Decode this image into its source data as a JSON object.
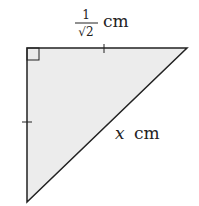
{
  "diagram": {
    "type": "right-isosceles-triangle",
    "fill_color": "#ececec",
    "stroke_color": "#222222",
    "labels": {
      "top_numerator": "1",
      "top_denominator": "√2",
      "top_unit": "cm",
      "hyp_var": "x",
      "hyp_unit": "cm"
    }
  }
}
